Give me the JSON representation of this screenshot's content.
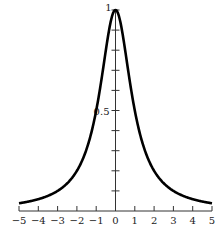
{
  "chart_data": {
    "type": "line",
    "title": "",
    "xlabel": "",
    "ylabel": "",
    "function": "y = 1/(1+x^2)",
    "xlim": [
      -5,
      5
    ],
    "ylim": [
      0,
      1
    ],
    "grid": false,
    "legend": null,
    "x_ticks": [
      -5,
      -4,
      -3,
      -2,
      -1,
      0,
      1,
      2,
      3,
      4,
      5
    ],
    "x_tick_labels": [
      "−5",
      "−4",
      "−3",
      "−2",
      "−1",
      "0",
      "1",
      "2",
      "3",
      "4",
      "5"
    ],
    "y_ticks": [
      0.1,
      0.2,
      0.3,
      0.4,
      0.5,
      0.6,
      0.7,
      0.8,
      0.9,
      1.0
    ],
    "y_tick_labels_shown": {
      "0.5": "0.5",
      "1": "1"
    },
    "series": [
      {
        "name": "curve",
        "x": [
          -5,
          -4,
          -3,
          -2,
          -1.5,
          -1,
          -0.5,
          0,
          0.5,
          1,
          1.5,
          2,
          3,
          4,
          5
        ],
        "values": [
          0.038,
          0.059,
          0.1,
          0.2,
          0.308,
          0.5,
          0.8,
          1.0,
          0.8,
          0.5,
          0.308,
          0.2,
          0.1,
          0.059,
          0.038
        ]
      }
    ]
  },
  "labels": {
    "y_half": "0.5",
    "y_one": "1"
  }
}
